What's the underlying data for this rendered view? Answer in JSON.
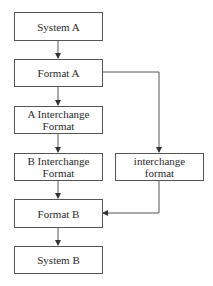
{
  "diagram": {
    "type": "flowchart",
    "nodes": [
      {
        "id": "system_a",
        "lines": [
          "System A"
        ]
      },
      {
        "id": "format_a",
        "lines": [
          "Format A"
        ]
      },
      {
        "id": "a_interchange",
        "lines": [
          "A Interchange",
          "Format"
        ]
      },
      {
        "id": "b_interchange",
        "lines": [
          "B Interchange",
          "Format"
        ]
      },
      {
        "id": "interchange",
        "lines": [
          "interchange",
          "format"
        ]
      },
      {
        "id": "format_b",
        "lines": [
          "Format B"
        ]
      },
      {
        "id": "system_b",
        "lines": [
          "System B"
        ]
      }
    ],
    "edges": [
      {
        "from": "system_a",
        "to": "format_a"
      },
      {
        "from": "format_a",
        "to": "a_interchange"
      },
      {
        "from": "a_interchange",
        "to": "b_interchange"
      },
      {
        "from": "b_interchange",
        "to": "format_b"
      },
      {
        "from": "format_a",
        "to": "interchange"
      },
      {
        "from": "interchange",
        "to": "format_b"
      },
      {
        "from": "format_b",
        "to": "system_b"
      }
    ],
    "colors": {
      "line": "#555555",
      "text": "#2a2a2a",
      "background": "#ffffff"
    }
  }
}
